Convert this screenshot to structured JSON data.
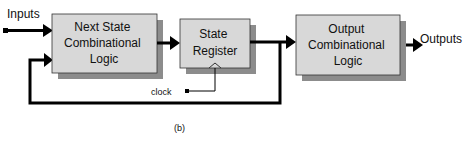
{
  "diagram": {
    "caption": "(b)",
    "inputs_label": "Inputs",
    "outputs_label": "Outputs",
    "clock_label": "clock",
    "blocks": [
      {
        "id": "next-state",
        "lines": [
          "Next State",
          "Combinational",
          "Logic"
        ]
      },
      {
        "id": "state-register",
        "lines": [
          "State",
          "Register"
        ]
      },
      {
        "id": "output-logic",
        "lines": [
          "Output",
          "Combinational",
          "Logic"
        ]
      }
    ],
    "colors": {
      "box_fill": "#d8d8d8",
      "box_shadow": "#8c8c8c",
      "line": "#000000"
    }
  }
}
